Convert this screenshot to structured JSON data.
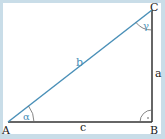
{
  "diagram": {
    "type": "right-triangle",
    "vertices": [
      {
        "label": "A",
        "x": 8,
        "y": 122
      },
      {
        "label": "B",
        "x": 152,
        "y": 122
      },
      {
        "label": "C",
        "x": 152,
        "y": 10
      }
    ],
    "sides": [
      {
        "label": "a",
        "from": "B",
        "to": "C"
      },
      {
        "label": "b",
        "from": "A",
        "to": "C",
        "color": "#4a90b8"
      },
      {
        "label": "c",
        "from": "A",
        "to": "B"
      }
    ],
    "angles": [
      {
        "label": "α",
        "vertex": "A"
      },
      {
        "label": "γ",
        "vertex": "C"
      },
      {
        "label": "·",
        "vertex": "B",
        "right_angle": true
      }
    ],
    "colors": {
      "hypotenuse": "#4a90b8",
      "legs": "#333333",
      "frame": "#c9dde8",
      "angle_label": "#4a90b8"
    }
  }
}
